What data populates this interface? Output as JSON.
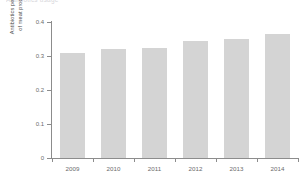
{
  "figure": {
    "title_remnant": "Antibiotics usage",
    "background_color": "#ffffff"
  },
  "chart_data": {
    "type": "bar",
    "title": "",
    "categories": [
      "2009",
      "2010",
      "2011",
      "2012",
      "2013",
      "2014"
    ],
    "values": [
      0.31,
      0.32,
      0.325,
      0.345,
      0.35,
      0.365
    ],
    "xlabel": "",
    "ylabel_line1": "Antibiotics per 1,000 kg",
    "ylabel_line2": "of meat produce (kg)",
    "ylim": [
      0,
      0.4
    ],
    "yticks": [
      "0",
      "0.1",
      "0.2",
      "0.3",
      "0.4"
    ],
    "ytick_values": [
      0,
      0.1,
      0.2,
      0.3,
      0.4
    ],
    "grid": false,
    "legend": false,
    "bar_color": "#d4d4d4",
    "axis_color": "#8c8c8c",
    "tick_label_color": "#6b6b6b"
  }
}
